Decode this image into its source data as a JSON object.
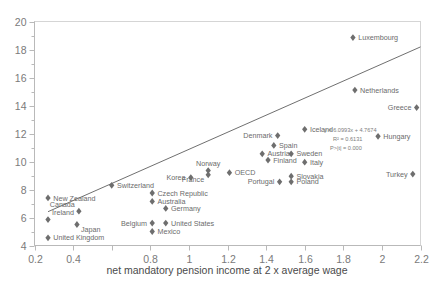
{
  "chart_data": {
    "type": "scatter",
    "title": "",
    "xlabel": "net mandatory pension income at 2 x average wage",
    "ylabel": "",
    "xlim": [
      0.2,
      2.2
    ],
    "ylim": [
      4,
      20
    ],
    "xticks": [
      "0.2",
      "0.4",
      "0.6",
      "0.8",
      "1",
      "1.2",
      "1.4",
      "1.6",
      "1.8",
      "2",
      "2.2"
    ],
    "xtick_labels_shown": [
      "0.2",
      "0.4",
      "0.8",
      "1",
      "1.2",
      "1.4",
      "1.6",
      "1.8",
      "2",
      "2.2"
    ],
    "yticks": [
      "4",
      "6",
      "8",
      "10",
      "12",
      "14",
      "16",
      "18",
      "20"
    ],
    "grid": false,
    "legend": "none",
    "marker_shape": "diamond",
    "marker_color": "#6e6e6e",
    "trendline": {
      "color": "#5f5f5f",
      "equation": "y = 6.0993x + 4.7674",
      "r_squared": "R² = 0.6131",
      "p_value": "P>|t| = 0.000",
      "slope": 6.0993,
      "intercept": 4.7674,
      "x_start": 0.27,
      "x_end": 2.2
    },
    "points": [
      {
        "label": "United Kingdom",
        "x": 0.27,
        "y": 4.55,
        "label_pos": "right"
      },
      {
        "label": "Ireland",
        "x": 0.27,
        "y": 5.85,
        "label_pos": "above-right"
      },
      {
        "label": "New Zealand",
        "x": 0.27,
        "y": 7.4,
        "label_pos": "right"
      },
      {
        "label": "Japan",
        "x": 0.42,
        "y": 5.5,
        "label_pos": "below-right"
      },
      {
        "label": "Canada",
        "x": 0.43,
        "y": 6.45,
        "label_pos": "above-left"
      },
      {
        "label": "Switzerland",
        "x": 0.6,
        "y": 8.3,
        "label_pos": "right"
      },
      {
        "label": "Belgium",
        "x": 0.81,
        "y": 5.6,
        "label_pos": "left"
      },
      {
        "label": "Mexico",
        "x": 0.81,
        "y": 5.0,
        "label_pos": "right"
      },
      {
        "label": "Australia",
        "x": 0.81,
        "y": 7.15,
        "label_pos": "right"
      },
      {
        "label": "Czech Republic",
        "x": 0.81,
        "y": 7.75,
        "label_pos": "right"
      },
      {
        "label": "United States",
        "x": 0.88,
        "y": 5.6,
        "label_pos": "right"
      },
      {
        "label": "Germany",
        "x": 0.88,
        "y": 6.65,
        "label_pos": "right"
      },
      {
        "label": "Korea",
        "x": 1.01,
        "y": 8.85,
        "label_pos": "left"
      },
      {
        "label": "Norway",
        "x": 1.1,
        "y": 9.35,
        "label_pos": "above"
      },
      {
        "label": "France",
        "x": 1.1,
        "y": 9.05,
        "label_pos": "below-left"
      },
      {
        "label": "OECD",
        "x": 1.21,
        "y": 9.2,
        "label_pos": "right"
      },
      {
        "label": "Austria",
        "x": 1.38,
        "y": 10.55,
        "label_pos": "right"
      },
      {
        "label": "Finland",
        "x": 1.41,
        "y": 10.1,
        "label_pos": "right"
      },
      {
        "label": "Spain",
        "x": 1.44,
        "y": 11.15,
        "label_pos": "right"
      },
      {
        "label": "Denmark",
        "x": 1.46,
        "y": 11.85,
        "label_pos": "left"
      },
      {
        "label": "Portugal",
        "x": 1.47,
        "y": 8.55,
        "label_pos": "left"
      },
      {
        "label": "Slovakia",
        "x": 1.53,
        "y": 8.95,
        "label_pos": "right"
      },
      {
        "label": "Poland",
        "x": 1.53,
        "y": 8.55,
        "label_pos": "right"
      },
      {
        "label": "Sweden",
        "x": 1.53,
        "y": 10.55,
        "label_pos": "right"
      },
      {
        "label": "Italy",
        "x": 1.6,
        "y": 9.95,
        "label_pos": "right"
      },
      {
        "label": "Iceland",
        "x": 1.6,
        "y": 12.3,
        "label_pos": "right"
      },
      {
        "label": "Netherlands",
        "x": 1.86,
        "y": 15.1,
        "label_pos": "right"
      },
      {
        "label": "Luxembourg",
        "x": 1.85,
        "y": 18.85,
        "label_pos": "right"
      },
      {
        "label": "Hungary",
        "x": 1.98,
        "y": 11.8,
        "label_pos": "right"
      },
      {
        "label": "Greece",
        "x": 2.18,
        "y": 13.85,
        "label_pos": "left"
      },
      {
        "label": "Turkey",
        "x": 2.16,
        "y": 9.1,
        "label_pos": "left"
      }
    ]
  }
}
